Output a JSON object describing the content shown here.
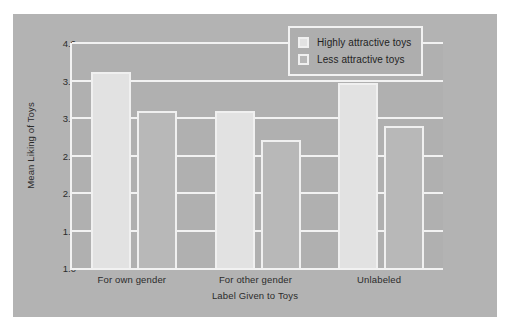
{
  "chart_data": {
    "type": "bar",
    "title": "",
    "xlabel": "Label Given to Toys",
    "ylabel": "Mean Liking of Toys",
    "categories": [
      "For own gender",
      "For other gender",
      "Unlabeled"
    ],
    "series": [
      {
        "name": "Highly attractive toys",
        "values": [
          3.62,
          3.09,
          3.47
        ],
        "color": "#e2e2e2"
      },
      {
        "name": "Less attractive toys",
        "values": [
          3.1,
          2.71,
          2.89
        ],
        "color": "#b8b8b8"
      }
    ],
    "ylim": [
      1.0,
      4.0
    ],
    "yticks": [
      "4.0",
      "3.5",
      "3.0",
      "2.5",
      "2.0",
      "1.5",
      "1.0"
    ],
    "ytick_values": [
      4.0,
      3.5,
      3.0,
      2.5,
      2.0,
      1.5,
      1.0
    ],
    "grid": true,
    "legend_position": "top-right",
    "panel_color": "#b3b3b3",
    "plot_color": "#b0b0b0",
    "grid_color": "#f2f2f2"
  },
  "legend": {
    "items": [
      {
        "label": "Highly attractive toys"
      },
      {
        "label": "Less attractive toys"
      }
    ]
  }
}
